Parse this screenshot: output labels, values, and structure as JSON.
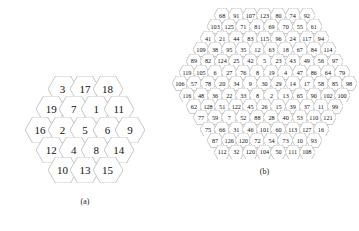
{
  "figure": {
    "panels": [
      {
        "id": "a",
        "caption": "(a)",
        "rows": [
          [
            3,
            17,
            18
          ],
          [
            19,
            7,
            1,
            11
          ],
          [
            16,
            2,
            5,
            6,
            9
          ],
          [
            12,
            4,
            8,
            14
          ],
          [
            10,
            13,
            15
          ]
        ]
      },
      {
        "id": "b",
        "caption": "(b)",
        "rows": [
          [
            68,
            91,
            107,
            123,
            80,
            74,
            92
          ],
          [
            103,
            125,
            71,
            81,
            69,
            70,
            55,
            61
          ],
          [
            41,
            21,
            44,
            83,
            115,
            96,
            24,
            117,
            94
          ],
          [
            109,
            38,
            95,
            35,
            12,
            63,
            18,
            67,
            84,
            114
          ],
          [
            89,
            82,
            124,
            25,
            42,
            5,
            23,
            43,
            49,
            56,
            97
          ],
          [
            119,
            105,
            6,
            27,
            76,
            8,
            19,
            4,
            47,
            86,
            64,
            79
          ],
          [
            106,
            57,
            78,
            20,
            34,
            9,
            30,
            29,
            14,
            17,
            58,
            85,
            98
          ],
          [
            116,
            48,
            36,
            22,
            33,
            8,
            2,
            13,
            65,
            90,
            102,
            100
          ],
          [
            62,
            128,
            51,
            122,
            45,
            26,
            15,
            39,
            37,
            11,
            99
          ],
          [
            77,
            59,
            7,
            52,
            88,
            28,
            40,
            53,
            110,
            121
          ],
          [
            75,
            66,
            31,
            46,
            101,
            60,
            113,
            127,
            16
          ],
          [
            87,
            126,
            120,
            72,
            54,
            73,
            10,
            93
          ],
          [
            112,
            32,
            120,
            104,
            50,
            111,
            108
          ]
        ]
      }
    ],
    "style": {
      "stroke_color": "#b9b9b9",
      "text_color": "#111111",
      "background": "#ffffff"
    }
  }
}
